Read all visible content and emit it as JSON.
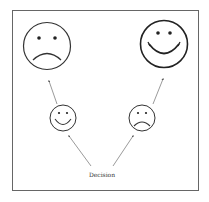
{
  "diagram": {
    "label": "Decision",
    "frame_color": "#555555",
    "stroke_color": "#333333",
    "nodes": [
      {
        "id": "left-outcome",
        "expression": "sad",
        "size": "large"
      },
      {
        "id": "right-outcome",
        "expression": "happy",
        "size": "large"
      },
      {
        "id": "left-choice",
        "expression": "happy",
        "size": "small"
      },
      {
        "id": "right-choice",
        "expression": "sad",
        "size": "small"
      }
    ]
  }
}
